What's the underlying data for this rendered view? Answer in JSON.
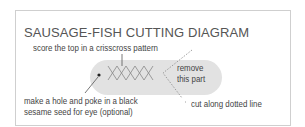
{
  "diagram": {
    "title": "SAUSAGE-FISH CUTTING DIAGRAM",
    "annotations": {
      "score": "score the top in a crisscross pattern",
      "remove_line1": "remove",
      "remove_line2": "this part",
      "eye_line1": "make a hole and poke in a black",
      "eye_line2": "sesame seed for eye (optional)",
      "cut": "cut along dotted line"
    },
    "colors": {
      "pill": "#e2e2e2",
      "text": "#444444",
      "border": "#cfcfcf"
    }
  }
}
